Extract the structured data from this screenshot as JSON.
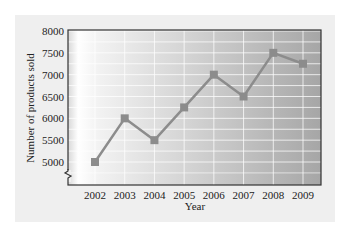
{
  "chart_data": {
    "type": "line",
    "title": "",
    "xlabel": "Year",
    "ylabel": "Number of products sold",
    "categories": [
      "2002",
      "2003",
      "2004",
      "2005",
      "2006",
      "2007",
      "2008",
      "2009"
    ],
    "values": [
      5000,
      6000,
      5500,
      6250,
      7000,
      6500,
      7500,
      7250
    ],
    "ylim": [
      4800,
      8000
    ],
    "yticks": [
      "5000",
      "5500",
      "6000",
      "6500",
      "7000",
      "7500",
      "8000"
    ],
    "y_axis_break": true,
    "grid": true,
    "legend": null,
    "colors": {
      "line": "#8c8c8c",
      "marker": "#8c8c8c",
      "frame": "#333333",
      "card_bg": "#efefef",
      "plot_gradient_start": "#ffffff",
      "plot_gradient_end": "#a8a8a8"
    }
  }
}
